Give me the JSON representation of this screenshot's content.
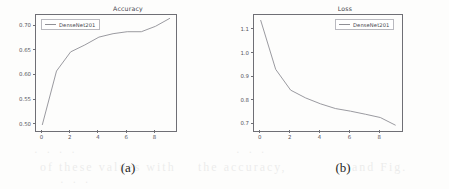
{
  "figure": {
    "subfigures": [
      {
        "caption": "(a)",
        "legend_label": "DenseNet201",
        "chart_data": {
          "type": "line",
          "title": "Accuracy",
          "xlabel": "",
          "ylabel": "",
          "xlim": [
            -0.45,
            9.45
          ],
          "ylim": [
            0.487,
            0.723
          ],
          "xticks": [
            0,
            2,
            4,
            6,
            8
          ],
          "xtick_labels": [
            "0",
            "2",
            "4",
            "6",
            "8"
          ],
          "yticks": [
            0.5,
            0.55,
            0.6,
            0.65,
            0.7
          ],
          "ytick_labels": [
            "0.50",
            "0.55",
            "0.60",
            "0.65",
            "0.70"
          ],
          "grid": false,
          "legend_position": "upper left",
          "series": [
            {
              "name": "DenseNet201",
              "color": "#8f8f95",
              "x": [
                0,
                1,
                2,
                3,
                4,
                5,
                6,
                7,
                8,
                9
              ],
              "values": [
                0.5,
                0.609,
                0.648,
                0.662,
                0.678,
                0.685,
                0.689,
                0.689,
                0.7,
                0.716
              ]
            }
          ]
        }
      },
      {
        "caption": "(b)",
        "legend_label": "DenseNet201",
        "chart_data": {
          "type": "line",
          "title": "Loss",
          "xlabel": "",
          "ylabel": "",
          "xlim": [
            -0.45,
            9.45
          ],
          "ylim": [
            0.672,
            1.163
          ],
          "xticks": [
            0,
            2,
            4,
            6,
            8
          ],
          "xtick_labels": [
            "0",
            "2",
            "4",
            "6",
            "8"
          ],
          "yticks": [
            0.7,
            0.8,
            0.9,
            1.0,
            1.1
          ],
          "ytick_labels": [
            "0.7",
            "0.8",
            "0.9",
            "1.0",
            "1.1"
          ],
          "grid": false,
          "legend_position": "upper right",
          "series": [
            {
              "name": "DenseNet201",
              "color": "#8f8f95",
              "x": [
                0,
                1,
                2,
                3,
                4,
                5,
                6,
                7,
                8,
                9
              ],
              "values": [
                1.14,
                0.933,
                0.845,
                0.812,
                0.787,
                0.767,
                0.756,
                0.743,
                0.729,
                0.697
              ]
            }
          ]
        }
      }
    ]
  },
  "scan_artifacts": {
    "bleed_lines": [
      "· · · ·",
      "· · ·",
      "of these values with",
      "the accuracy,",
      "and Fig.",
      "· · ·"
    ]
  }
}
